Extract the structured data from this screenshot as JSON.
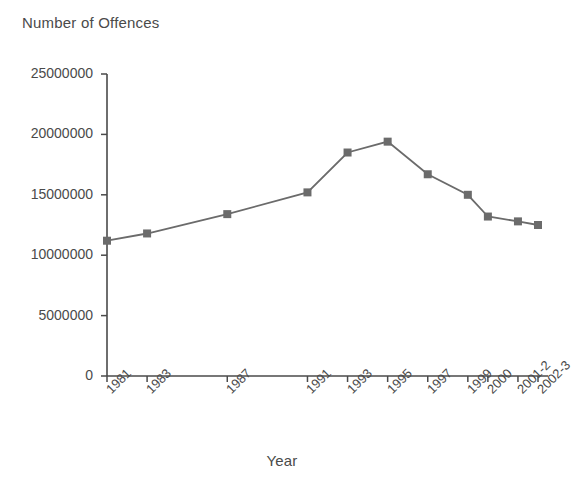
{
  "chart_data": {
    "type": "line",
    "title": "",
    "ylabel": "Number of Offences",
    "xlabel": "Year",
    "categories": [
      "1981",
      "1983",
      "1987",
      "1991",
      "1993",
      "1995",
      "1997",
      "1999",
      "2000",
      "2001-2",
      "2002-3"
    ],
    "values": [
      11200000,
      11800000,
      13400000,
      15200000,
      18500000,
      19400000,
      16700000,
      15000000,
      13200000,
      12800000,
      12500000
    ],
    "series": [
      {
        "name": "Number of Offences",
        "values": [
          11200000,
          11800000,
          13400000,
          15200000,
          18500000,
          19400000,
          16700000,
          15000000,
          13200000,
          12800000,
          12500000
        ]
      }
    ],
    "x_positions": [
      1981,
      1983,
      1987,
      1991,
      1993,
      1995,
      1997,
      1999,
      2000,
      2001.5,
      2002.5
    ],
    "ylim": [
      0,
      25000000
    ],
    "ytick_labels": [
      "0",
      "5000000",
      "10000000",
      "15000000",
      "20000000",
      "25000000"
    ],
    "ytick_values": [
      0,
      5000000,
      10000000,
      15000000,
      20000000,
      25000000
    ],
    "grid": false,
    "legend": "none",
    "marker": "square",
    "line_color": "#6b6b6b",
    "marker_color": "#6b6b6b",
    "axis_color": "#4a4a4a",
    "background_color": "#ffffff"
  },
  "axis_titles": {
    "y": "Number of Offences",
    "x": "Year"
  }
}
